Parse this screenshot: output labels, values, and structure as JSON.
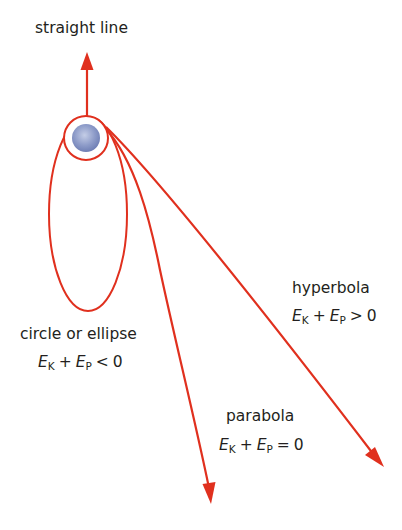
{
  "diagram": {
    "colors": {
      "trajectory": "#e0301e",
      "text": "#231f20",
      "ball": "#8e9cc9",
      "background": "#ffffff"
    },
    "body": {
      "name": "central-mass",
      "center": [
        86,
        138
      ],
      "ring_radius": 22,
      "ball_radius": 14
    },
    "trajectories": [
      {
        "name": "straight line",
        "label": "straight line",
        "condition": null
      },
      {
        "name": "circle or ellipse",
        "label": "circle or ellipse",
        "condition": {
          "lhs_e1": "E",
          "lhs_s1": "K",
          "op_plus": "+",
          "lhs_e2": "E",
          "lhs_s2": "P",
          "rel": "<",
          "rhs": "0"
        }
      },
      {
        "name": "parabola",
        "label": "parabola",
        "condition": {
          "lhs_e1": "E",
          "lhs_s1": "K",
          "op_plus": "+",
          "lhs_e2": "E",
          "lhs_s2": "P",
          "rel": "=",
          "rhs": "0"
        }
      },
      {
        "name": "hyperbola",
        "label": "hyperbola",
        "condition": {
          "lhs_e1": "E",
          "lhs_s1": "K",
          "op_plus": "+",
          "lhs_e2": "E",
          "lhs_s2": "P",
          "rel": ">",
          "rhs": "0"
        }
      }
    ]
  }
}
